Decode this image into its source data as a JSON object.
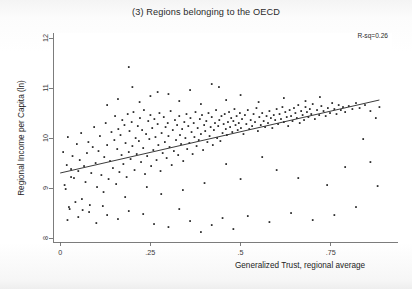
{
  "figure": {
    "title": "(3) Regions belonging to the OECD",
    "annotation": "R-sq=0.26",
    "background_color": "#ffffff",
    "axis_color": "#6e6e6e",
    "point_color": "#1c1c1c",
    "line_color": "#2f2f2f"
  },
  "chart_data": {
    "type": "scatter",
    "title": "(3) Regions belonging to the OECD",
    "xlabel": "Generalized Trust, regional average",
    "ylabel": "Regional Income per Capita (ln)",
    "xlim": [
      -0.02,
      0.92
    ],
    "ylim": [
      7.92,
      12.1
    ],
    "xticks": [
      0,
      0.25,
      0.5,
      0.75
    ],
    "xticklabels": [
      "0",
      ".25",
      ".5",
      ".75"
    ],
    "yticks": [
      8,
      9,
      10,
      11,
      12
    ],
    "yticklabels": [
      "8",
      "9",
      "10",
      "11",
      "12"
    ],
    "grid": false,
    "legend": null,
    "annotations": [
      {
        "text": "R-sq=0.26",
        "position": "top-right",
        "value": 0.26
      }
    ],
    "fit_line": {
      "type": "linear",
      "x_start": 0.0,
      "y_start": 9.3,
      "x_end": 0.885,
      "y_end": 10.76,
      "slope": 1.65,
      "intercept": 9.3,
      "r_squared": 0.26
    },
    "n_points": 281,
    "points": [
      [
        0.008,
        9.72
      ],
      [
        0.012,
        9.06
      ],
      [
        0.015,
        8.98
      ],
      [
        0.018,
        9.46
      ],
      [
        0.021,
        10.02
      ],
      [
        0.024,
        8.62
      ],
      [
        0.026,
        8.58
      ],
      [
        0.03,
        9.38
      ],
      [
        0.034,
        9.64
      ],
      [
        0.038,
        9.2
      ],
      [
        0.042,
        8.72
      ],
      [
        0.046,
        9.88
      ],
      [
        0.05,
        9.34
      ],
      [
        0.054,
        9.56
      ],
      [
        0.058,
        10.1
      ],
      [
        0.062,
        8.56
      ],
      [
        0.066,
        9.44
      ],
      [
        0.07,
        9.12
      ],
      [
        0.074,
        9.7
      ],
      [
        0.078,
        9.92
      ],
      [
        0.082,
        8.66
      ],
      [
        0.086,
        9.3
      ],
      [
        0.09,
        9.82
      ],
      [
        0.094,
        10.22
      ],
      [
        0.098,
        9.5
      ],
      [
        0.102,
        9.02
      ],
      [
        0.106,
        9.74
      ],
      [
        0.11,
        10.04
      ],
      [
        0.114,
        9.26
      ],
      [
        0.118,
        8.64
      ],
      [
        0.122,
        9.62
      ],
      [
        0.126,
        10.3
      ],
      [
        0.13,
        9.86
      ],
      [
        0.134,
        9.18
      ],
      [
        0.138,
        9.54
      ],
      [
        0.142,
        10.12
      ],
      [
        0.146,
        9.4
      ],
      [
        0.15,
        9.96
      ],
      [
        0.152,
        10.44
      ],
      [
        0.155,
        9.08
      ],
      [
        0.158,
        9.78
      ],
      [
        0.161,
        10.18
      ],
      [
        0.164,
        9.32
      ],
      [
        0.167,
        10.06
      ],
      [
        0.17,
        9.66
      ],
      [
        0.172,
        10.36
      ],
      [
        0.175,
        9.48
      ],
      [
        0.178,
        10.26
      ],
      [
        0.181,
        9.9
      ],
      [
        0.184,
        9.22
      ],
      [
        0.187,
        10.48
      ],
      [
        0.19,
        9.72
      ],
      [
        0.192,
        10.14
      ],
      [
        0.195,
        9.58
      ],
      [
        0.198,
        10.32
      ],
      [
        0.2,
        9.84
      ],
      [
        0.203,
        10.52
      ],
      [
        0.206,
        9.36
      ],
      [
        0.209,
        10.0
      ],
      [
        0.212,
        9.68
      ],
      [
        0.215,
        10.24
      ],
      [
        0.218,
        9.94
      ],
      [
        0.221,
        10.4
      ],
      [
        0.224,
        9.52
      ],
      [
        0.227,
        10.16
      ],
      [
        0.23,
        9.8
      ],
      [
        0.232,
        10.56
      ],
      [
        0.235,
        9.28
      ],
      [
        0.238,
        10.08
      ],
      [
        0.241,
        9.64
      ],
      [
        0.244,
        10.34
      ],
      [
        0.247,
        9.98
      ],
      [
        0.25,
        10.46
      ],
      [
        0.252,
        9.44
      ],
      [
        0.255,
        10.2
      ],
      [
        0.258,
        9.76
      ],
      [
        0.261,
        10.38
      ],
      [
        0.264,
        10.02
      ],
      [
        0.267,
        9.56
      ],
      [
        0.27,
        10.28
      ],
      [
        0.272,
        9.86
      ],
      [
        0.275,
        10.5
      ],
      [
        0.278,
        9.34
      ],
      [
        0.281,
        10.1
      ],
      [
        0.284,
        9.7
      ],
      [
        0.287,
        10.42
      ],
      [
        0.29,
        9.92
      ],
      [
        0.292,
        10.22
      ],
      [
        0.295,
        9.6
      ],
      [
        0.298,
        10.3
      ],
      [
        0.3,
        10.04
      ],
      [
        0.303,
        9.82
      ],
      [
        0.306,
        10.54
      ],
      [
        0.309,
        9.46
      ],
      [
        0.312,
        10.16
      ],
      [
        0.315,
        9.74
      ],
      [
        0.318,
        10.36
      ],
      [
        0.321,
        9.96
      ],
      [
        0.324,
        10.26
      ],
      [
        0.327,
        9.66
      ],
      [
        0.33,
        10.44
      ],
      [
        0.332,
        10.06
      ],
      [
        0.335,
        9.88
      ],
      [
        0.338,
        10.18
      ],
      [
        0.341,
        9.54
      ],
      [
        0.344,
        10.32
      ],
      [
        0.347,
        10.0
      ],
      [
        0.35,
        10.48
      ],
      [
        0.352,
        9.78
      ],
      [
        0.355,
        10.24
      ],
      [
        0.358,
        9.9
      ],
      [
        0.361,
        10.4
      ],
      [
        0.364,
        10.12
      ],
      [
        0.367,
        9.68
      ],
      [
        0.37,
        10.3
      ],
      [
        0.372,
        10.02
      ],
      [
        0.375,
        10.52
      ],
      [
        0.378,
        9.84
      ],
      [
        0.381,
        10.2
      ],
      [
        0.384,
        9.96
      ],
      [
        0.387,
        10.38
      ],
      [
        0.39,
        10.08
      ],
      [
        0.393,
        10.46
      ],
      [
        0.396,
        9.76
      ],
      [
        0.399,
        10.26
      ],
      [
        0.402,
        10.14
      ],
      [
        0.405,
        10.34
      ],
      [
        0.408,
        9.92
      ],
      [
        0.411,
        10.5
      ],
      [
        0.414,
        10.04
      ],
      [
        0.417,
        10.22
      ],
      [
        0.42,
        10.42
      ],
      [
        0.423,
        9.86
      ],
      [
        0.426,
        10.16
      ],
      [
        0.429,
        10.3
      ],
      [
        0.432,
        10.56
      ],
      [
        0.435,
        10.0
      ],
      [
        0.438,
        10.24
      ],
      [
        0.441,
        10.36
      ],
      [
        0.444,
        9.94
      ],
      [
        0.447,
        10.44
      ],
      [
        0.45,
        10.1
      ],
      [
        0.453,
        10.28
      ],
      [
        0.456,
        10.48
      ],
      [
        0.459,
        10.18
      ],
      [
        0.462,
        10.06
      ],
      [
        0.465,
        10.32
      ],
      [
        0.468,
        10.52
      ],
      [
        0.471,
        10.22
      ],
      [
        0.474,
        10.4
      ],
      [
        0.477,
        10.12
      ],
      [
        0.48,
        10.34
      ],
      [
        0.483,
        10.58
      ],
      [
        0.486,
        10.26
      ],
      [
        0.489,
        10.44
      ],
      [
        0.492,
        10.16
      ],
      [
        0.495,
        10.3
      ],
      [
        0.498,
        10.5
      ],
      [
        0.501,
        10.2
      ],
      [
        0.504,
        10.38
      ],
      [
        0.508,
        10.08
      ],
      [
        0.512,
        10.46
      ],
      [
        0.516,
        10.28
      ],
      [
        0.52,
        10.56
      ],
      [
        0.524,
        10.18
      ],
      [
        0.528,
        10.36
      ],
      [
        0.532,
        10.24
      ],
      [
        0.536,
        10.48
      ],
      [
        0.54,
        10.32
      ],
      [
        0.544,
        10.6
      ],
      [
        0.548,
        10.14
      ],
      [
        0.552,
        10.42
      ],
      [
        0.556,
        10.26
      ],
      [
        0.56,
        10.5
      ],
      [
        0.564,
        10.34
      ],
      [
        0.568,
        10.22
      ],
      [
        0.572,
        10.44
      ],
      [
        0.576,
        10.3
      ],
      [
        0.58,
        10.54
      ],
      [
        0.584,
        10.4
      ],
      [
        0.588,
        10.2
      ],
      [
        0.592,
        10.46
      ],
      [
        0.596,
        10.36
      ],
      [
        0.6,
        10.58
      ],
      [
        0.604,
        10.28
      ],
      [
        0.608,
        10.48
      ],
      [
        0.612,
        10.38
      ],
      [
        0.616,
        10.62
      ],
      [
        0.62,
        10.32
      ],
      [
        0.624,
        10.52
      ],
      [
        0.628,
        10.42
      ],
      [
        0.632,
        10.24
      ],
      [
        0.636,
        10.56
      ],
      [
        0.64,
        10.44
      ],
      [
        0.644,
        10.34
      ],
      [
        0.648,
        10.6
      ],
      [
        0.652,
        10.5
      ],
      [
        0.656,
        10.4
      ],
      [
        0.66,
        10.66
      ],
      [
        0.664,
        10.3
      ],
      [
        0.668,
        10.54
      ],
      [
        0.672,
        10.46
      ],
      [
        0.676,
        10.36
      ],
      [
        0.68,
        10.62
      ],
      [
        0.684,
        10.52
      ],
      [
        0.688,
        10.42
      ],
      [
        0.692,
        10.58
      ],
      [
        0.696,
        10.48
      ],
      [
        0.7,
        10.68
      ],
      [
        0.706,
        10.38
      ],
      [
        0.712,
        10.56
      ],
      [
        0.718,
        10.46
      ],
      [
        0.724,
        10.64
      ],
      [
        0.73,
        10.54
      ],
      [
        0.736,
        10.44
      ],
      [
        0.742,
        10.6
      ],
      [
        0.748,
        10.5
      ],
      [
        0.754,
        10.7
      ],
      [
        0.76,
        10.58
      ],
      [
        0.766,
        10.48
      ],
      [
        0.772,
        10.66
      ],
      [
        0.778,
        10.56
      ],
      [
        0.784,
        10.62
      ],
      [
        0.79,
        10.52
      ],
      [
        0.8,
        10.64
      ],
      [
        0.81,
        10.58
      ],
      [
        0.82,
        10.7
      ],
      [
        0.83,
        10.6
      ],
      [
        0.845,
        10.66
      ],
      [
        0.86,
        10.54
      ],
      [
        0.875,
        10.4
      ],
      [
        0.885,
        10.62
      ],
      [
        0.19,
        11.42
      ],
      [
        0.27,
        10.92
      ],
      [
        0.3,
        10.88
      ],
      [
        0.36,
        10.96
      ],
      [
        0.42,
        11.08
      ],
      [
        0.46,
        10.76
      ],
      [
        0.13,
        10.66
      ],
      [
        0.16,
        10.78
      ],
      [
        0.22,
        10.72
      ],
      [
        0.25,
        10.84
      ],
      [
        0.33,
        10.74
      ],
      [
        0.39,
        10.68
      ],
      [
        0.5,
        10.86
      ],
      [
        0.55,
        10.72
      ],
      [
        0.62,
        10.8
      ],
      [
        0.68,
        10.74
      ],
      [
        0.72,
        10.82
      ],
      [
        0.44,
        11.02
      ],
      [
        0.2,
        11.02
      ],
      [
        0.02,
        8.36
      ],
      [
        0.05,
        8.42
      ],
      [
        0.08,
        8.52
      ],
      [
        0.1,
        8.3
      ],
      [
        0.13,
        8.46
      ],
      [
        0.16,
        8.38
      ],
      [
        0.19,
        8.54
      ],
      [
        0.23,
        8.48
      ],
      [
        0.26,
        8.28
      ],
      [
        0.3,
        8.22
      ],
      [
        0.33,
        8.58
      ],
      [
        0.36,
        8.34
      ],
      [
        0.39,
        8.12
      ],
      [
        0.42,
        8.26
      ],
      [
        0.45,
        8.4
      ],
      [
        0.48,
        8.18
      ],
      [
        0.52,
        8.44
      ],
      [
        0.58,
        8.32
      ],
      [
        0.64,
        8.5
      ],
      [
        0.7,
        8.36
      ],
      [
        0.76,
        8.46
      ],
      [
        0.82,
        8.62
      ],
      [
        0.88,
        9.04
      ],
      [
        0.86,
        9.52
      ],
      [
        0.84,
        9.98
      ],
      [
        0.79,
        9.42
      ],
      [
        0.74,
        9.06
      ],
      [
        0.66,
        9.2
      ],
      [
        0.6,
        9.36
      ],
      [
        0.56,
        9.62
      ],
      [
        0.5,
        9.18
      ],
      [
        0.46,
        9.48
      ],
      [
        0.4,
        9.1
      ],
      [
        0.34,
        8.96
      ],
      [
        0.28,
        8.88
      ],
      [
        0.24,
        9.02
      ],
      [
        0.18,
        8.82
      ],
      [
        0.12,
        8.92
      ],
      [
        0.06,
        8.78
      ],
      [
        0.03,
        9.22
      ]
    ]
  }
}
